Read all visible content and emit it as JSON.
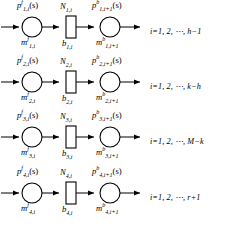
{
  "diagram": {
    "type": "petri-net-rows",
    "row_count": 4,
    "geometry": {
      "place_radius": 10,
      "transition_width": 10,
      "transition_height": 22,
      "row_spacing": 55
    },
    "rows": [
      {
        "id": 1,
        "place_in_label": "p",
        "place_in_sup": "f",
        "place_in_sub": "1,i",
        "place_in_arg": "(s)",
        "transition_label": "N",
        "transition_sub": "1,i",
        "place_out_label": "p",
        "place_out_sup": "b",
        "place_out_sub": "1,i+1",
        "place_out_arg": "(s)",
        "marking_in_label": "m",
        "marking_in_sup": "f",
        "marking_in_sub": "1,i",
        "capacity_label": "b",
        "capacity_sub": "1,i",
        "marking_out_label": "m",
        "marking_out_sup": "b",
        "marking_out_sub": "1,i+1",
        "index_range": "i=1, 2, ⋯, h−1"
      },
      {
        "id": 2,
        "place_in_label": "p",
        "place_in_sup": "f",
        "place_in_sub": "2,i",
        "place_in_arg": "(s)",
        "transition_label": "N",
        "transition_sub": "2,i",
        "place_out_label": "p",
        "place_out_sup": "b",
        "place_out_sub": "2,i+1",
        "place_out_arg": "(s)",
        "marking_in_label": "m",
        "marking_in_sup": "f",
        "marking_in_sub": "2,i",
        "capacity_label": "b",
        "capacity_sub": "2,i",
        "marking_out_label": "m",
        "marking_out_sup": "b",
        "marking_out_sub": "2,i+1",
        "index_range": "i=1, 2, ⋯, k−h"
      },
      {
        "id": 3,
        "place_in_label": "p",
        "place_in_sup": "f",
        "place_in_sub": "3,i",
        "place_in_arg": "(s)",
        "transition_label": "N",
        "transition_sub": "3,i",
        "place_out_label": "p",
        "place_out_sup": "b",
        "place_out_sub": "3,i+1",
        "place_out_arg": "(s)",
        "marking_in_label": "m",
        "marking_in_sup": "f",
        "marking_in_sub": "3,i",
        "capacity_label": "b",
        "capacity_sub": "3,i",
        "marking_out_label": "m",
        "marking_out_sup": "b",
        "marking_out_sub": "3,i+1",
        "index_range": "i=1, 2, ⋯, M−k"
      },
      {
        "id": 4,
        "place_in_label": "p",
        "place_in_sup": "f",
        "place_in_sub": "4,i",
        "place_in_arg": "(s)",
        "transition_label": "N",
        "transition_sub": "4,i",
        "place_out_label": "p",
        "place_out_sup": "b",
        "place_out_sub": "4,i+1",
        "place_out_arg": "(s)",
        "marking_in_label": "m",
        "marking_in_sup": "f",
        "marking_in_sub": "4,i",
        "capacity_label": "b",
        "capacity_sub": "4,i",
        "marking_out_label": "m",
        "marking_out_sup": "b",
        "marking_out_sub": "4,i+1",
        "index_range": "i=1, 2, ⋯, r+1"
      }
    ]
  },
  "colors": {
    "stroke": "#000000",
    "background": "#ffffff",
    "text": "#000000"
  }
}
